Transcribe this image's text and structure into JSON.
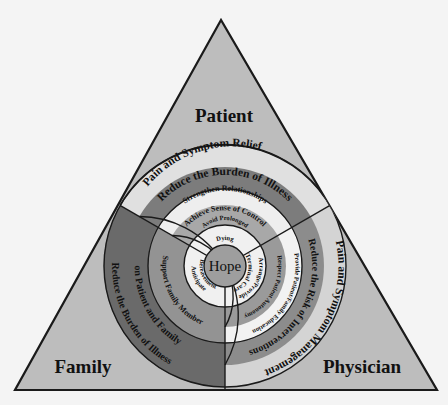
{
  "diagram": {
    "type": "triangle-with-concentric-rings",
    "colors": {
      "background": "#f4f4f4",
      "triangle_fill": "#bdbdbd",
      "outline": "#1a1a1a",
      "dark_band": "#6e6e6e",
      "mid_band": "#9a9a9a",
      "light_band": "#e6e6e6",
      "hope_fill": "#9e9e9e"
    },
    "corners": {
      "top": "Patient",
      "left": "Family",
      "right": "Physician"
    },
    "center": "Hope",
    "patient_sector": {
      "rings": [
        "Pain and Symptom Relief",
        "Reduce the Burden of Illness",
        "Strengthen Relationships",
        "Achieve Sense of Control",
        "Avoid Prolonged Dying"
      ]
    },
    "family_sector": {
      "rings": [
        "Reduce the Burden of Illness on Patient and Family",
        "Support Family Member",
        "Anticipate Bereavement"
      ],
      "outer_line1": "Reduce the Burden of Illness",
      "outer_line2": "on Patient and Family"
    },
    "physician_sector": {
      "rings": [
        "Pain and Symptom Management",
        "Reduce the Risk of Interventions",
        "Provide Patient/Family Education",
        "Respect Patient Autonomy",
        "Arrange/Provide Terminal Care"
      ]
    }
  }
}
